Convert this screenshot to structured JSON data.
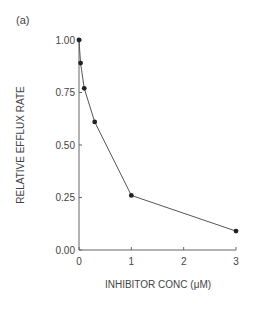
{
  "panel_label": "(a)",
  "chart_data": {
    "type": "line",
    "title": "",
    "xlabel": "INHIBITOR CONC (μM)",
    "ylabel": "RELATIVE EFFLUX RATE",
    "x": [
      0,
      0.03,
      0.1,
      0.3,
      1,
      3
    ],
    "series": [
      {
        "name": "Relative efflux rate",
        "values": [
          1.0,
          0.89,
          0.77,
          0.61,
          0.26,
          0.09
        ]
      }
    ],
    "xlim": [
      0,
      3
    ],
    "ylim": [
      0,
      1
    ],
    "xticks": [
      "0",
      "1",
      "2",
      "3"
    ],
    "yticks": [
      "0.00",
      "0.25",
      "0.50",
      "0.75",
      "1.00"
    ],
    "grid": false,
    "legend": "none",
    "marker": "filled-circle"
  }
}
